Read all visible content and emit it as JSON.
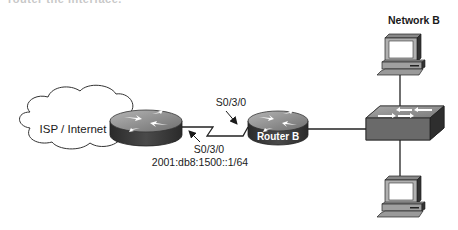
{
  "diagram": {
    "truncated_caption": "router the interface.",
    "cloud": {
      "label": "ISP / Internet"
    },
    "router_a": {
      "interface": "S0/3/0",
      "address": "2001:db8:1500::1/64"
    },
    "router_b": {
      "label": "Router B",
      "interface": "S0/3/0"
    },
    "network_label": "Network B",
    "switch": {
      "label": ""
    },
    "hosts": [
      {
        "position": "top"
      },
      {
        "position": "bottom"
      }
    ],
    "colors": {
      "router_top": "#8a8a8a",
      "router_side": "#3a3a3a",
      "switch_top": "#9a9a9a",
      "switch_side": "#555555",
      "line": "#333333"
    }
  }
}
